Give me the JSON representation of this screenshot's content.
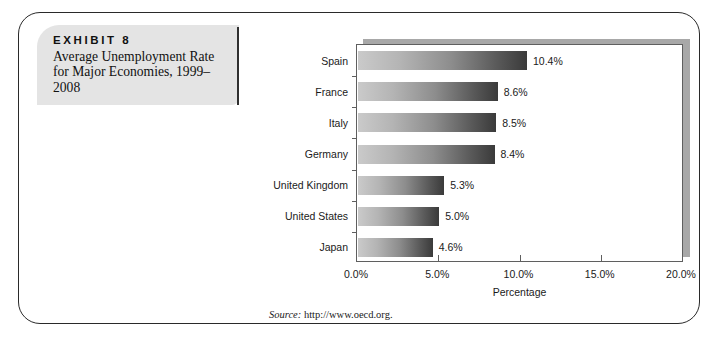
{
  "exhibit": {
    "title": "EXHIBIT 8",
    "subtitle": "Average Unemployment Rate for Major Economies, 1999–2008"
  },
  "source": {
    "prefix": "Source:",
    "url": "http://www.oecd.org."
  },
  "chart_data": {
    "type": "bar",
    "orientation": "horizontal",
    "title": "",
    "xlabel": "Percentage",
    "ylabel": "",
    "xlim": [
      0,
      20
    ],
    "xticks": [
      "0.0%",
      "5.0%",
      "10.0%",
      "15.0%",
      "20.0%"
    ],
    "xtick_values": [
      0,
      5,
      10,
      15,
      20
    ],
    "grid": false,
    "legend": false,
    "categories": [
      "Spain",
      "France",
      "Italy",
      "Germany",
      "United Kingdom",
      "United States",
      "Japan"
    ],
    "values": [
      10.4,
      8.6,
      8.5,
      8.4,
      5.3,
      5.0,
      4.6
    ],
    "data_labels": [
      "10.4%",
      "8.6%",
      "8.5%",
      "8.4%",
      "5.3%",
      "5.0%",
      "4.6%"
    ],
    "bar_gradient": [
      "#cacaca",
      "#3a3a3a"
    ]
  }
}
